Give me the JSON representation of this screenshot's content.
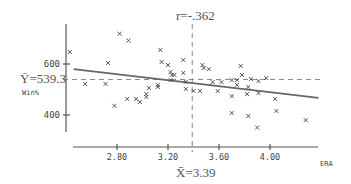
{
  "chart_data": {
    "type": "scatter",
    "title": "",
    "xlabel": "ERA",
    "ylabel": "Win%",
    "x_ticks": [
      "2.80",
      "3.20",
      "3.60",
      "4.00"
    ],
    "y_ticks": [
      "400",
      "600"
    ],
    "xlim": [
      2.44,
      4.44
    ],
    "ylim": [
      340,
      720
    ],
    "annotations": {
      "correlation": "r=-.362",
      "x_mean_label": "X̄=3.39",
      "y_mean_label": "Ȳ=539.3",
      "x_mean": 3.39,
      "y_mean": 539.3
    },
    "regression_line": {
      "x": [
        2.46,
        4.38
      ],
      "y": [
        580,
        467
      ]
    },
    "points": [
      {
        "x": 2.43,
        "y": 647
      },
      {
        "x": 2.55,
        "y": 522
      },
      {
        "x": 2.71,
        "y": 522
      },
      {
        "x": 2.73,
        "y": 604
      },
      {
        "x": 2.82,
        "y": 719
      },
      {
        "x": 2.89,
        "y": 692
      },
      {
        "x": 2.78,
        "y": 436
      },
      {
        "x": 2.88,
        "y": 463
      },
      {
        "x": 2.95,
        "y": 463
      },
      {
        "x": 2.98,
        "y": 451
      },
      {
        "x": 3.03,
        "y": 482
      },
      {
        "x": 3.05,
        "y": 506
      },
      {
        "x": 3.03,
        "y": 471
      },
      {
        "x": 3.14,
        "y": 655
      },
      {
        "x": 3.15,
        "y": 608
      },
      {
        "x": 3.2,
        "y": 596
      },
      {
        "x": 3.22,
        "y": 569
      },
      {
        "x": 3.23,
        "y": 557
      },
      {
        "x": 3.25,
        "y": 557
      },
      {
        "x": 3.12,
        "y": 518
      },
      {
        "x": 3.12,
        "y": 510
      },
      {
        "x": 3.22,
        "y": 537
      },
      {
        "x": 3.32,
        "y": 616
      },
      {
        "x": 3.32,
        "y": 565
      },
      {
        "x": 3.34,
        "y": 530
      },
      {
        "x": 3.34,
        "y": 502
      },
      {
        "x": 3.4,
        "y": 494
      },
      {
        "x": 3.45,
        "y": 494
      },
      {
        "x": 3.47,
        "y": 596
      },
      {
        "x": 3.48,
        "y": 584
      },
      {
        "x": 3.52,
        "y": 580
      },
      {
        "x": 3.55,
        "y": 529
      },
      {
        "x": 3.62,
        "y": 529
      },
      {
        "x": 3.59,
        "y": 494
      },
      {
        "x": 3.7,
        "y": 537
      },
      {
        "x": 3.7,
        "y": 474
      },
      {
        "x": 3.7,
        "y": 408
      },
      {
        "x": 3.77,
        "y": 592
      },
      {
        "x": 3.78,
        "y": 557
      },
      {
        "x": 3.74,
        "y": 537
      },
      {
        "x": 3.74,
        "y": 518
      },
      {
        "x": 3.83,
        "y": 510
      },
      {
        "x": 3.82,
        "y": 482
      },
      {
        "x": 3.85,
        "y": 541
      },
      {
        "x": 3.91,
        "y": 533
      },
      {
        "x": 3.91,
        "y": 486
      },
      {
        "x": 3.97,
        "y": 545
      },
      {
        "x": 3.83,
        "y": 396
      },
      {
        "x": 3.9,
        "y": 351
      },
      {
        "x": 4.04,
        "y": 463
      },
      {
        "x": 4.05,
        "y": 416
      },
      {
        "x": 4.28,
        "y": 380
      }
    ],
    "grid": false,
    "legend": "none"
  }
}
